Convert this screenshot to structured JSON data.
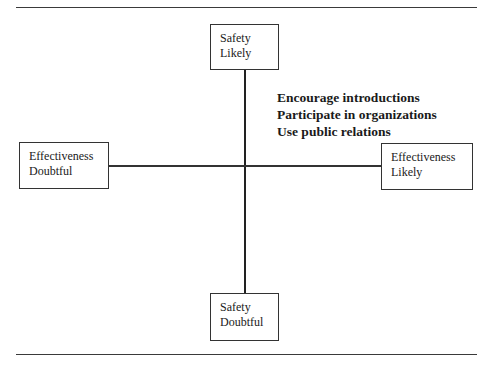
{
  "diagram": {
    "type": "quadrant",
    "axes": {
      "vertical": {
        "top": {
          "line1": "Safety",
          "line2": "Likely"
        },
        "bottom": {
          "line1": "Safety",
          "line2": "Doubtful"
        }
      },
      "horizontal": {
        "left": {
          "line1": "Effectiveness",
          "line2": "Doubtful"
        },
        "right": {
          "line1": "Effectiveness",
          "line2": "Likely"
        }
      }
    },
    "quadrant_top_right": {
      "items": [
        "Encourage introductions",
        "Participate in organizations",
        "Use public relations"
      ]
    }
  }
}
